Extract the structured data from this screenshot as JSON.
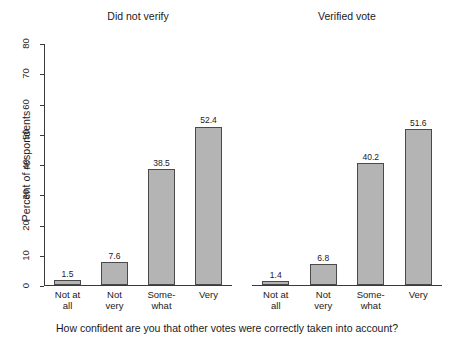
{
  "chart_data": {
    "type": "bar",
    "title": "",
    "xlabel": "How confident are you that other votes were correctly taken into account?",
    "ylabel": "Percent of respondents",
    "ylim": [
      0,
      80
    ],
    "yticks": [
      0,
      10,
      20,
      30,
      40,
      50,
      60,
      70,
      80
    ],
    "grid": false,
    "legend": "none",
    "categories": [
      "Not at\nall",
      "Not\nvery",
      "Some-\nwhat",
      "Very"
    ],
    "panels": [
      {
        "title": "Did not verify",
        "values": [
          1.5,
          7.6,
          38.5,
          52.4
        ],
        "labels": [
          "1.5",
          "7.6",
          "38.5",
          "52.4"
        ]
      },
      {
        "title": "Verified vote",
        "values": [
          1.4,
          6.8,
          40.2,
          51.6
        ],
        "labels": [
          "1.4",
          "6.8",
          "40.2",
          "51.6"
        ]
      }
    ],
    "bar_color": "#b4b4b4",
    "bar_edge_color": "#4a4a4a",
    "axis_color": "#3a3a3a"
  }
}
